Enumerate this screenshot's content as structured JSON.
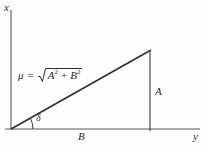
{
  "figure": {
    "background_color": "#fdfdfd",
    "line_color": "#3a3a3a",
    "text_color": "#2b2b2b"
  },
  "axes": {
    "vertical_label": "x",
    "horizontal_label": "y",
    "origin": {
      "x": 11,
      "y": 129
    },
    "vertical_top": {
      "x": 11,
      "y": 10
    },
    "horizontal_right": {
      "x": 200,
      "y": 129
    }
  },
  "triangle": {
    "hypotenuse_start": {
      "x": 11,
      "y": 129
    },
    "hypotenuse_end": {
      "x": 150,
      "y": 51
    },
    "vertical_leg_top": {
      "x": 150,
      "y": 51
    },
    "vertical_leg_bottom": {
      "x": 150,
      "y": 129
    },
    "adjacent_label": "B",
    "opposite_label": "A",
    "angle_label": "δ",
    "angle_arc_radius": 22
  },
  "formula": {
    "lhs": "μ",
    "equals": "=",
    "radicand_first_base": "A",
    "radicand_first_exp": "2",
    "operator": "+",
    "radicand_second_base": "B",
    "radicand_second_exp": "2",
    "plain_text": "μ = √(A² + B²)"
  }
}
